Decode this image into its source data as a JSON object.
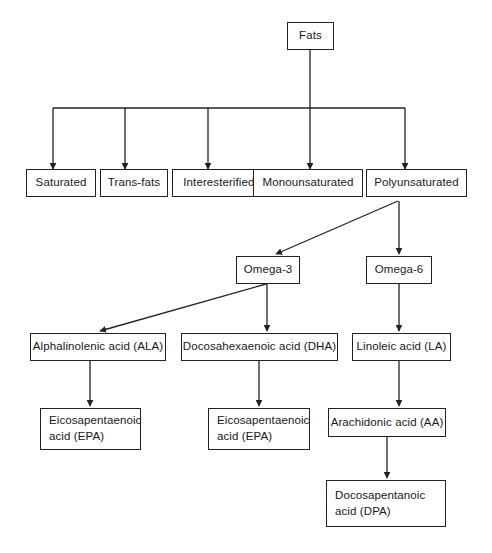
{
  "diagram": {
    "type": "flowchart",
    "line_color": "#222222",
    "background_color": "#ffffff",
    "text_color": "#181818",
    "nodes": {
      "fats": "Fats",
      "saturated": "Saturated",
      "trans_fats": "Trans-fats",
      "interesterified": "Interesterified fats",
      "monounsaturated": "Monounsaturated",
      "polyunsaturated": "Polyunsaturated",
      "omega3": "Omega-3",
      "omega6": "Omega-6",
      "ala": "Alphalinolenic acid (ALA)",
      "dha": "Docosahexaenoic acid (DHA)",
      "la": "Linoleic acid (LA)",
      "epa_left": "Eicosapentaenoic\nacid (EPA)",
      "epa_middle": "Eicosapentaenoic\nacid (EPA)",
      "aa": "Arachidonic acid (AA)",
      "dpa": "Docosapentanoic\nacid (DPA)"
    },
    "edges": [
      {
        "from": "fats",
        "to": "saturated"
      },
      {
        "from": "fats",
        "to": "trans_fats"
      },
      {
        "from": "fats",
        "to": "interesterified"
      },
      {
        "from": "fats",
        "to": "monounsaturated"
      },
      {
        "from": "fats",
        "to": "polyunsaturated"
      },
      {
        "from": "polyunsaturated",
        "to": "omega3"
      },
      {
        "from": "polyunsaturated",
        "to": "omega6"
      },
      {
        "from": "omega3",
        "to": "ala"
      },
      {
        "from": "omega3",
        "to": "dha"
      },
      {
        "from": "omega6",
        "to": "la"
      },
      {
        "from": "ala",
        "to": "epa_left"
      },
      {
        "from": "dha",
        "to": "epa_middle"
      },
      {
        "from": "la",
        "to": "aa"
      },
      {
        "from": "aa",
        "to": "dpa"
      }
    ]
  }
}
